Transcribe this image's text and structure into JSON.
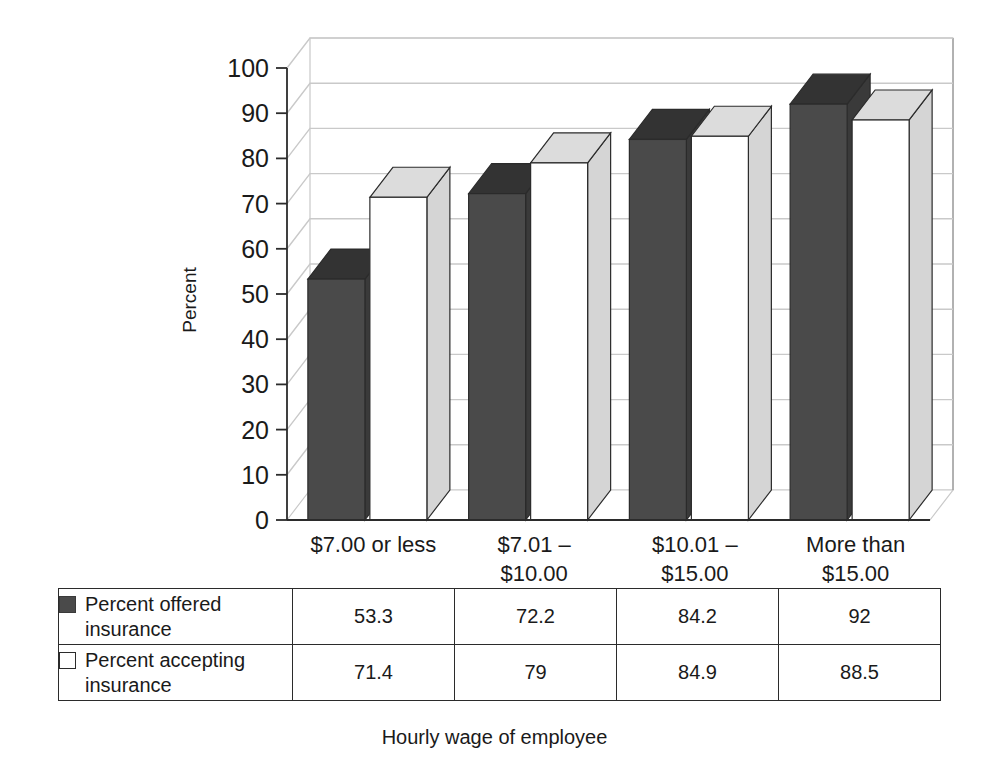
{
  "chart_data": {
    "type": "bar",
    "title": "",
    "subtitle": "",
    "xlabel": "Hourly wage of employee",
    "ylabel": "Percent",
    "ylim": [
      0,
      100
    ],
    "ytick_step": 10,
    "yticks": [
      0,
      10,
      20,
      30,
      40,
      50,
      60,
      70,
      80,
      90,
      100
    ],
    "grid": true,
    "grid_axis": "y",
    "legend_position": "table-below",
    "style": "3d-clustered-column",
    "categories": [
      "$7.00 or less",
      "$7.01 – $10.00",
      "$10.01 – $15.00",
      "More than $15.00"
    ],
    "category_lines": [
      [
        "$7.00 or less"
      ],
      [
        "$7.01 –",
        "$10.00"
      ],
      [
        "$10.01 –",
        "$15.00"
      ],
      [
        "More than",
        "$15.00"
      ]
    ],
    "series": [
      {
        "name": "Percent offered insurance",
        "name_lines": [
          "Percent offered",
          "insurance"
        ],
        "swatch": "filled",
        "color": "#4a4a4a",
        "top_color": "#333333",
        "side_color": "#3a3a3a",
        "values": [
          53.3,
          72.2,
          84.2,
          92
        ],
        "value_labels": [
          "53.3",
          "72.2",
          "84.2",
          "92"
        ]
      },
      {
        "name": "Percent accepting insurance",
        "name_lines": [
          "Percent accepting",
          "insurance"
        ],
        "swatch": "hollow",
        "color": "#ffffff",
        "top_color": "#dcdcdc",
        "side_color": "#d5d5d5",
        "values": [
          71.4,
          79,
          84.9,
          88.5
        ],
        "value_labels": [
          "71.4",
          "79",
          "84.9",
          "88.5"
        ]
      }
    ]
  },
  "axis": {
    "ytick_labels": [
      "100",
      "90",
      "80",
      "70",
      "60",
      "50",
      "40",
      "30",
      "20",
      "10",
      "0"
    ],
    "ylabel": "Percent",
    "xlabel": "Hourly wage of employee"
  },
  "table": {
    "rows": [
      {
        "swatch": "filled",
        "label_line1": "Percent offered",
        "label_line2": "insurance",
        "values": [
          "53.3",
          "72.2",
          "84.2",
          "92"
        ]
      },
      {
        "swatch": "hollow",
        "label_line1": "Percent accepting",
        "label_line2": "insurance",
        "values": [
          "71.4",
          "79",
          "84.9",
          "88.5"
        ]
      }
    ]
  },
  "colors": {
    "series1_front": "#4a4a4a",
    "series1_top": "#333333",
    "series2_front": "#ffffff",
    "series2_top": "#dcdcdc",
    "series2_side": "#d5d5d5",
    "gridline": "#c9c9c9",
    "axis": "#2b2b2b",
    "floor": "#d5d5d5"
  }
}
